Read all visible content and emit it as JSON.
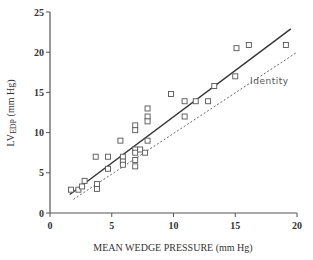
{
  "chart_data": {
    "type": "scatter",
    "title": "",
    "xlabel": "MEAN WEDGE PRESSURE (mm Hg)",
    "ylabel_main": "LV",
    "ylabel_sub": "EDP",
    "ylabel_unit": " (mm Hg)",
    "xlim": [
      0,
      20
    ],
    "ylim": [
      0,
      25
    ],
    "x_ticks": [
      0,
      5,
      10,
      15,
      20
    ],
    "y_ticks": [
      0,
      5,
      10,
      15,
      20,
      25
    ],
    "grid": false,
    "marker": "open-square",
    "points": [
      [
        1.7,
        2.9
      ],
      [
        2.3,
        2.9
      ],
      [
        2.6,
        3.3
      ],
      [
        2.8,
        4.0
      ],
      [
        3.8,
        3.0
      ],
      [
        3.8,
        3.6
      ],
      [
        3.7,
        7.0
      ],
      [
        4.7,
        7.0
      ],
      [
        4.7,
        5.5
      ],
      [
        5.7,
        9.0
      ],
      [
        5.9,
        7.0
      ],
      [
        5.9,
        6.4
      ],
      [
        5.9,
        6.0
      ],
      [
        6.9,
        10.9
      ],
      [
        6.9,
        10.3
      ],
      [
        6.9,
        7.9
      ],
      [
        6.9,
        7.5
      ],
      [
        6.9,
        6.6
      ],
      [
        6.9,
        5.8
      ],
      [
        7.3,
        7.9
      ],
      [
        7.7,
        7.5
      ],
      [
        7.9,
        13.0
      ],
      [
        7.9,
        12.0
      ],
      [
        7.9,
        11.4
      ],
      [
        7.9,
        9.0
      ],
      [
        9.8,
        14.8
      ],
      [
        10.9,
        13.9
      ],
      [
        10.9,
        12.0
      ],
      [
        11.8,
        13.9
      ],
      [
        12.8,
        13.9
      ],
      [
        13.3,
        15.8
      ],
      [
        15.0,
        17.0
      ],
      [
        15.1,
        20.5
      ],
      [
        16.1,
        20.9
      ],
      [
        19.1,
        20.9
      ]
    ],
    "lines": [
      {
        "name": "Regression",
        "style": "solid",
        "x": [
          1.6,
          19.5
        ],
        "y": [
          2.3,
          22.9
        ]
      },
      {
        "name": "Identity",
        "style": "dotted",
        "x": [
          1.9,
          20.0
        ],
        "y": [
          1.7,
          20.0
        ]
      }
    ],
    "annotations": [
      {
        "text": "Identity",
        "x": 16.2,
        "y": 16.0
      }
    ]
  }
}
